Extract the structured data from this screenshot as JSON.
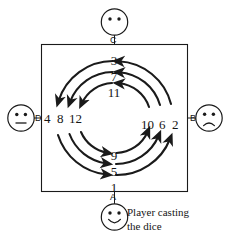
{
  "diagram": {
    "board": {
      "name": "square-board",
      "stroke_color": "#1a1a1a"
    },
    "players": [
      {
        "id": "A",
        "label": "A",
        "position": "bottom",
        "face": "smiling",
        "caption_line1": "Player casting",
        "caption_line2": "the dice"
      },
      {
        "id": "B",
        "label": "B",
        "position": "right",
        "face": "frowning",
        "caption_line1": "",
        "caption_line2": ""
      },
      {
        "id": "C",
        "label": "C",
        "position": "top",
        "face": "blank",
        "caption_line1": "",
        "caption_line2": ""
      },
      {
        "id": "D",
        "label": "D",
        "position": "left",
        "face": "neutral",
        "caption_line1": "",
        "caption_line2": ""
      }
    ],
    "number_groups": [
      {
        "name": "top-numbers",
        "position": "top",
        "values": [
          "3",
          "7",
          "11"
        ]
      },
      {
        "name": "left-numbers",
        "position": "left",
        "values": [
          "4",
          "8",
          "12"
        ]
      },
      {
        "name": "bottom-numbers",
        "position": "bottom",
        "values": [
          "9",
          "5",
          "1"
        ]
      },
      {
        "name": "right-numbers",
        "position": "right",
        "values": [
          "10",
          "6",
          "2"
        ]
      }
    ]
  }
}
